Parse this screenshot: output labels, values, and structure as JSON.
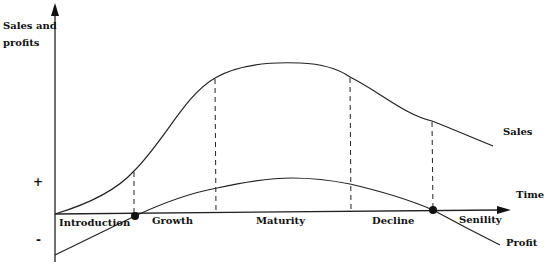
{
  "diagram": {
    "y_axis_label_line1": "Sales and",
    "y_axis_label_line2": "profits",
    "x_axis_label": "Time",
    "plus_sign": "+",
    "minus_sign": "-",
    "curves": {
      "sales_label": "Sales",
      "profit_label": "Profit"
    },
    "stages": [
      {
        "label": "Introduction"
      },
      {
        "label": "Growth"
      },
      {
        "label": "Maturity"
      },
      {
        "label": "Decline"
      },
      {
        "label": "Senility"
      }
    ],
    "colors": {
      "line": "#222222",
      "background": "#ffffff"
    }
  }
}
